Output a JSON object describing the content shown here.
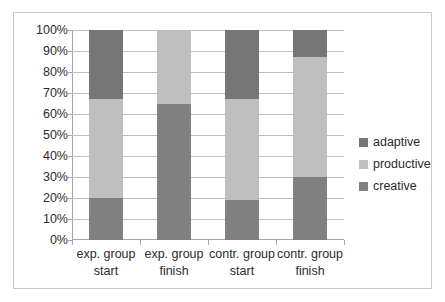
{
  "chart_data": {
    "type": "bar",
    "stacked": true,
    "title": "",
    "xlabel": "",
    "ylabel": "",
    "ylim": [
      0,
      100
    ],
    "y_unit": "%",
    "grid": true,
    "legend_position": "right",
    "categories": [
      "exp. group start",
      "exp. group finish",
      "contr. group start",
      "contr. group finish"
    ],
    "category_lines": [
      [
        "exp. group",
        "start"
      ],
      [
        "exp. group",
        "finish"
      ],
      [
        "contr. group",
        "start"
      ],
      [
        "contr. group",
        "finish"
      ]
    ],
    "ytick_labels": [
      "100%",
      "90%",
      "80%",
      "70%",
      "60%",
      "50%",
      "40%",
      "30%",
      "20%",
      "10%",
      "0%"
    ],
    "ytick_values": [
      100,
      90,
      80,
      70,
      60,
      50,
      40,
      30,
      20,
      10,
      0
    ],
    "series": [
      {
        "name": "creative",
        "color": "#808080",
        "values": [
          20,
          65,
          19,
          30
        ]
      },
      {
        "name": "productive",
        "color": "#bfbfbf",
        "values": [
          47,
          35,
          48,
          57
        ]
      },
      {
        "name": "adaptive",
        "color": "#767676",
        "values": [
          33,
          0,
          33,
          13
        ]
      }
    ],
    "legend_order": [
      "adaptive",
      "productive",
      "creative"
    ],
    "stack_boundaries": [
      [
        0,
        20,
        67,
        100
      ],
      [
        0,
        65,
        100,
        100
      ],
      [
        0,
        19,
        67,
        100
      ],
      [
        0,
        30,
        87,
        100
      ]
    ],
    "colors": {
      "creative": "#808080",
      "productive": "#bfbfbf",
      "adaptive": "#767676",
      "gridline": "#bfbfbf",
      "axis": "#a6a6a6",
      "frame": "#c9c9c9",
      "text": "#2b2b2b",
      "background": "#ffffff"
    }
  }
}
